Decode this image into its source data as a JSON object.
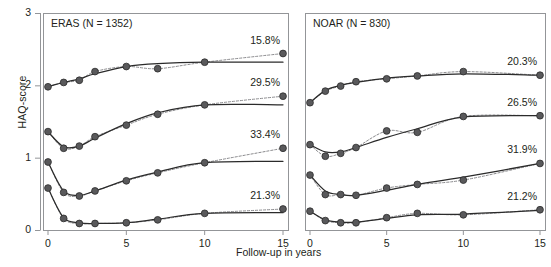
{
  "chart_data": {
    "type": "line",
    "title": "",
    "xlabel": "Follow-up in years",
    "ylabel": "HAQ-score",
    "xlim": [
      0,
      15
    ],
    "ylim": [
      0,
      3
    ],
    "xticks": [
      0,
      5,
      10,
      15
    ],
    "yticks": [
      0,
      1,
      2,
      3
    ],
    "grid": false,
    "legend": "none",
    "marker": "filled-circle",
    "panels": [
      {
        "id": "eras",
        "title": "ERAS (N = 1352)",
        "series": [
          {
            "name": "ERAS cluster 1",
            "label": "15.8%",
            "x": [
              0,
              1,
              2,
              3,
              5,
              7,
              10,
              15
            ],
            "observed": [
              1.98,
              2.04,
              2.07,
              2.19,
              2.26,
              2.23,
              2.32,
              2.44
            ],
            "fitted": [
              1.98,
              2.04,
              2.09,
              2.16,
              2.26,
              2.3,
              2.32,
              2.32
            ]
          },
          {
            "name": "ERAS cluster 2",
            "label": "29.5%",
            "x": [
              0,
              1,
              2,
              3,
              5,
              7,
              10,
              15
            ],
            "observed": [
              1.36,
              1.13,
              1.16,
              1.29,
              1.45,
              1.6,
              1.73,
              1.85
            ],
            "fitted": [
              1.36,
              1.15,
              1.16,
              1.27,
              1.47,
              1.62,
              1.73,
              1.73
            ]
          },
          {
            "name": "ERAS cluster 3",
            "label": "33.4%",
            "x": [
              0,
              1,
              2,
              3,
              5,
              7,
              10,
              15
            ],
            "observed": [
              0.94,
              0.52,
              0.47,
              0.54,
              0.68,
              0.79,
              0.93,
              1.13
            ],
            "fitted": [
              0.94,
              0.54,
              0.48,
              0.54,
              0.69,
              0.8,
              0.93,
              0.95
            ]
          },
          {
            "name": "ERAS cluster 4",
            "label": "21.3%",
            "x": [
              0,
              1,
              2,
              3,
              5,
              7,
              10,
              15
            ],
            "observed": [
              0.58,
              0.16,
              0.09,
              0.09,
              0.1,
              0.14,
              0.23,
              0.29
            ],
            "fitted": [
              0.58,
              0.17,
              0.1,
              0.09,
              0.1,
              0.15,
              0.23,
              0.24
            ]
          }
        ]
      },
      {
        "id": "noar",
        "title": "NOAR (N = 830)",
        "series": [
          {
            "name": "NOAR cluster 1",
            "label": "20.3%",
            "x": [
              0,
              1,
              2,
              3,
              5,
              7,
              10,
              15
            ],
            "observed": [
              1.76,
              1.92,
              1.99,
              2.05,
              2.09,
              2.13,
              2.19,
              2.14
            ],
            "fitted": [
              1.76,
              1.93,
              2.0,
              2.04,
              2.1,
              2.13,
              2.16,
              2.14
            ]
          },
          {
            "name": "NOAR cluster 2",
            "label": "26.5%",
            "x": [
              0,
              1,
              2,
              3,
              5,
              7,
              10,
              15
            ],
            "observed": [
              1.18,
              1.02,
              1.06,
              1.14,
              1.37,
              1.35,
              1.57,
              1.58
            ],
            "fitted": [
              1.18,
              1.08,
              1.08,
              1.14,
              1.28,
              1.4,
              1.56,
              1.58
            ]
          },
          {
            "name": "NOAR cluster 3",
            "label": "31.9%",
            "x": [
              0,
              1,
              2,
              3,
              5,
              7,
              10,
              15
            ],
            "observed": [
              0.76,
              0.49,
              0.49,
              0.48,
              0.58,
              0.63,
              0.69,
              0.92
            ],
            "fitted": [
              0.76,
              0.54,
              0.49,
              0.48,
              0.55,
              0.63,
              0.73,
              0.92
            ]
          },
          {
            "name": "NOAR cluster 4",
            "label": "21.2%",
            "x": [
              0,
              1,
              2,
              3,
              5,
              7,
              10,
              15
            ],
            "observed": [
              0.26,
              0.13,
              0.1,
              0.1,
              0.17,
              0.23,
              0.21,
              0.28
            ],
            "fitted": [
              0.26,
              0.14,
              0.11,
              0.11,
              0.16,
              0.21,
              0.22,
              0.27
            ]
          }
        ]
      }
    ],
    "colors": {
      "line": "#2b2b2b",
      "marker": "#59595b",
      "marker_edge": "#2b2b2b",
      "dashed": "#8a8a8d",
      "axis": "#939598",
      "text": "#231f20"
    }
  }
}
